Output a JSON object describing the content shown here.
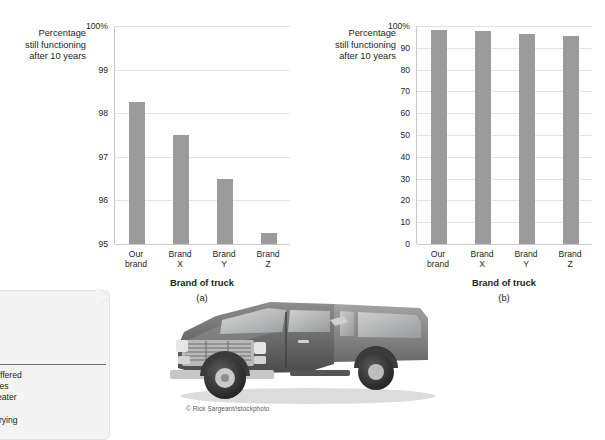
{
  "figure_a": {
    "panel_letter": "(a)",
    "y_axis_label": "Percentage\nstill functioning\nafter 10 years",
    "x_axis_title": "Brand of truck",
    "y_ticks": [
      "100%",
      "99",
      "98",
      "97",
      "96",
      "95"
    ],
    "categories": [
      "Our\nbrand",
      "Brand\nX",
      "Brand\nY",
      "Brand\nZ"
    ]
  },
  "figure_b": {
    "panel_letter": "(b)",
    "y_axis_label": "Percentage\nstill functioning\nafter 10 years",
    "x_axis_title": "Brand of truck",
    "y_ticks": [
      "100%",
      "90",
      "80",
      "70",
      "60",
      "50",
      "40",
      "30",
      "20",
      "10",
      "0"
    ],
    "categories": [
      "Our\nbrand",
      "Brand\nX",
      "Brand\nY",
      "Brand\nZ"
    ]
  },
  "callout": {
    "line1": "acturer offered",
    "line2": "and names",
    "line3": "much greater",
    "line4": "hat does",
    "line5": "ut the varying"
  },
  "photo": {
    "credit": "© Rick Sargeant/istockphoto",
    "subject": "pickup-truck"
  },
  "colors": {
    "bar": "#9b9b9b",
    "grid": "#e2e2e2",
    "axis": "#c9c9c9",
    "text": "#231f20",
    "callout_bg": "#f4f4f4"
  },
  "chart_data": [
    {
      "type": "bar",
      "title": "(a)",
      "categories": [
        "Our brand",
        "Brand X",
        "Brand Y",
        "Brand Z"
      ],
      "values": [
        98.25,
        97.5,
        96.5,
        95.25
      ],
      "xlabel": "Brand of truck",
      "ylabel": "Percentage still functioning after 10 years",
      "ylim": [
        95,
        100
      ],
      "yticks": [
        95,
        96,
        97,
        98,
        99,
        100
      ],
      "ytick_labels": [
        "95",
        "96",
        "97",
        "98",
        "99",
        "100%"
      ],
      "grid": true,
      "legend": "none"
    },
    {
      "type": "bar",
      "title": "(b)",
      "categories": [
        "Our brand",
        "Brand X",
        "Brand Y",
        "Brand Z"
      ],
      "values": [
        98.25,
        97.5,
        96.5,
        95.25
      ],
      "xlabel": "Brand of truck",
      "ylabel": "Percentage still functioning after 10 years",
      "ylim": [
        0,
        100
      ],
      "yticks": [
        0,
        10,
        20,
        30,
        40,
        50,
        60,
        70,
        80,
        90,
        100
      ],
      "ytick_labels": [
        "0",
        "10",
        "20",
        "30",
        "40",
        "50",
        "60",
        "70",
        "80",
        "90",
        "100%"
      ],
      "grid": true,
      "legend": "none"
    }
  ]
}
